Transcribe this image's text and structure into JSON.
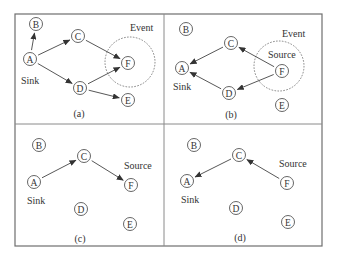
{
  "figure": {
    "frame": {
      "x": 15,
      "y": 14,
      "width": 307,
      "height": 232
    },
    "divider_x": 164,
    "divider_y": 124,
    "colors": {
      "stroke": "#555555",
      "text": "#333333",
      "background": "#ffffff"
    }
  },
  "panels": [
    {
      "caption": "(a)",
      "caption_pos": [
        79,
        117
      ],
      "nodes": [
        {
          "id": "B",
          "x": 36,
          "y": 24
        },
        {
          "id": "A",
          "x": 30,
          "y": 59
        },
        {
          "id": "C",
          "x": 78,
          "y": 36
        },
        {
          "id": "D",
          "x": 80,
          "y": 88
        },
        {
          "id": "F",
          "x": 128,
          "y": 63
        },
        {
          "id": "E",
          "x": 128,
          "y": 100
        }
      ],
      "edges": [
        [
          "A",
          "B"
        ],
        [
          "A",
          "C"
        ],
        [
          "A",
          "D"
        ],
        [
          "C",
          "F"
        ],
        [
          "D",
          "F"
        ],
        [
          "D",
          "E"
        ]
      ],
      "event_circle": {
        "cx": 130,
        "cy": 62,
        "r": 25
      },
      "labels": [
        {
          "text": "Event",
          "x": 130,
          "y": 31
        },
        {
          "text": "Sink",
          "x": 21,
          "y": 84
        }
      ]
    },
    {
      "caption": "(b)",
      "caption_pos": [
        231,
        118
      ],
      "nodes": [
        {
          "id": "B",
          "x": 186,
          "y": 29
        },
        {
          "id": "A",
          "x": 182,
          "y": 68
        },
        {
          "id": "C",
          "x": 231,
          "y": 43
        },
        {
          "id": "D",
          "x": 229,
          "y": 93
        },
        {
          "id": "F",
          "x": 282,
          "y": 71
        },
        {
          "id": "E",
          "x": 282,
          "y": 105
        }
      ],
      "edges": [
        [
          "C",
          "A"
        ],
        [
          "D",
          "A"
        ],
        [
          "F",
          "C"
        ],
        [
          "F",
          "D"
        ]
      ],
      "event_circle": {
        "cx": 279,
        "cy": 66,
        "r": 25
      },
      "labels": [
        {
          "text": "Event",
          "x": 282,
          "y": 37
        },
        {
          "text": "Source",
          "x": 268,
          "y": 58
        },
        {
          "text": "Sink",
          "x": 173,
          "y": 90
        }
      ]
    },
    {
      "caption": "(c)",
      "caption_pos": [
        80,
        242
      ],
      "nodes": [
        {
          "id": "B",
          "x": 39,
          "y": 145
        },
        {
          "id": "A",
          "x": 34,
          "y": 182
        },
        {
          "id": "C",
          "x": 84,
          "y": 156
        },
        {
          "id": "D",
          "x": 81,
          "y": 209
        },
        {
          "id": "F",
          "x": 131,
          "y": 185
        },
        {
          "id": "E",
          "x": 130,
          "y": 224
        }
      ],
      "edges": [
        [
          "A",
          "C"
        ],
        [
          "C",
          "F"
        ]
      ],
      "event_circle": null,
      "labels": [
        {
          "text": "Source",
          "x": 124,
          "y": 169
        },
        {
          "text": "Sink",
          "x": 27,
          "y": 204
        }
      ]
    },
    {
      "caption": "(d)",
      "caption_pos": [
        240,
        241
      ],
      "nodes": [
        {
          "id": "B",
          "x": 194,
          "y": 145
        },
        {
          "id": "A",
          "x": 187,
          "y": 181
        },
        {
          "id": "C",
          "x": 239,
          "y": 155
        },
        {
          "id": "D",
          "x": 236,
          "y": 208
        },
        {
          "id": "F",
          "x": 287,
          "y": 183
        },
        {
          "id": "E",
          "x": 288,
          "y": 222
        }
      ],
      "edges": [
        [
          "C",
          "A"
        ],
        [
          "F",
          "C"
        ]
      ],
      "event_circle": null,
      "labels": [
        {
          "text": "Source",
          "x": 279,
          "y": 167
        },
        {
          "text": "Sink",
          "x": 181,
          "y": 203
        }
      ]
    }
  ]
}
